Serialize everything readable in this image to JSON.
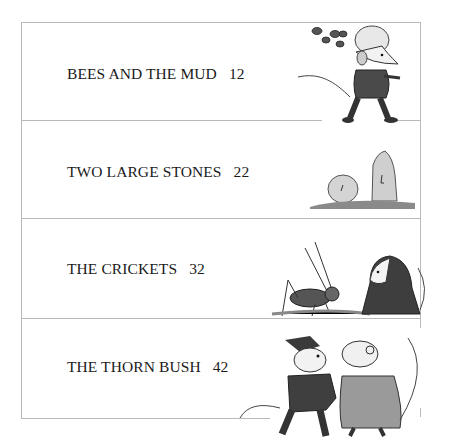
{
  "contents": {
    "entries": [
      {
        "title": "BEES AND THE MUD",
        "page": "12",
        "illustration": "mouse-with-bees-illustration"
      },
      {
        "title": "TWO LARGE STONES",
        "page": "22",
        "illustration": "two-stones-illustration"
      },
      {
        "title": "THE CRICKETS",
        "page": "32",
        "illustration": "cricket-and-mouse-illustration"
      },
      {
        "title": "THE THORN BUSH",
        "page": "42",
        "illustration": "two-mice-illustration"
      }
    ]
  },
  "colors": {
    "rule": "#b9b9b9",
    "text": "#1a1a1a",
    "ink": "#3a3a3a"
  }
}
